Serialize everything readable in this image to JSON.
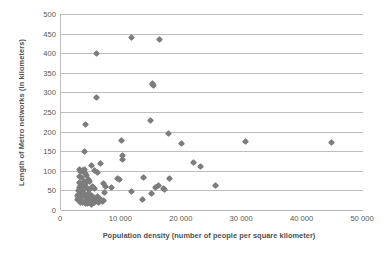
{
  "chart_data": {
    "type": "scatter",
    "title": "",
    "xlabel": "Population density (number of people per square kilometer)",
    "ylabel": "Length of Metro networks (in kilometers)",
    "xlim": [
      0,
      50000
    ],
    "ylim": [
      0,
      500
    ],
    "xticks": [
      0,
      10000,
      20000,
      30000,
      40000,
      50000
    ],
    "xtick_labels": [
      "0",
      "10 000",
      "20 000",
      "30 000",
      "40 000",
      "50 000"
    ],
    "yticks": [
      0,
      50,
      100,
      150,
      200,
      250,
      300,
      350,
      400,
      450,
      500
    ],
    "ytick_labels": [
      "0",
      "50",
      "100",
      "150",
      "200",
      "250",
      "300",
      "350",
      "400",
      "450",
      "500"
    ],
    "grid": "horizontal",
    "legend": "none",
    "marker": "diamond",
    "marker_color": "#7d7d7d",
    "series": [
      {
        "name": "Metro systems",
        "points": [
          [
            11700,
            441
          ],
          [
            16300,
            435
          ],
          [
            5800,
            399
          ],
          [
            5900,
            286
          ],
          [
            15100,
            322
          ],
          [
            15300,
            317
          ],
          [
            15200,
            319
          ],
          [
            4000,
            219
          ],
          [
            14900,
            229
          ],
          [
            17800,
            196
          ],
          [
            30500,
            176
          ],
          [
            44800,
            171
          ],
          [
            19900,
            169
          ],
          [
            10000,
            178
          ],
          [
            3900,
            148
          ],
          [
            10100,
            140
          ],
          [
            10200,
            130
          ],
          [
            21900,
            121
          ],
          [
            23100,
            110
          ],
          [
            5000,
            113
          ],
          [
            6600,
            118
          ],
          [
            3000,
            103
          ],
          [
            3300,
            99
          ],
          [
            3500,
            101
          ],
          [
            3700,
            97
          ],
          [
            3900,
            104
          ],
          [
            4100,
            93
          ],
          [
            4300,
            88
          ],
          [
            3100,
            86
          ],
          [
            3400,
            82
          ],
          [
            5600,
            100
          ],
          [
            6000,
            96
          ],
          [
            9300,
            80
          ],
          [
            9700,
            79
          ],
          [
            18000,
            81
          ],
          [
            13700,
            84
          ],
          [
            25600,
            62
          ],
          [
            7000,
            67
          ],
          [
            7400,
            59
          ],
          [
            7200,
            45
          ],
          [
            8400,
            57
          ],
          [
            11700,
            47
          ],
          [
            13500,
            26
          ],
          [
            15000,
            43
          ],
          [
            15600,
            58
          ],
          [
            16100,
            62
          ],
          [
            16900,
            54
          ],
          [
            17200,
            53
          ],
          [
            3000,
            70
          ],
          [
            3200,
            63
          ],
          [
            3600,
            66
          ],
          [
            4000,
            60
          ],
          [
            4400,
            56
          ],
          [
            4800,
            52
          ],
          [
            5200,
            61
          ],
          [
            5600,
            55
          ],
          [
            2900,
            50
          ],
          [
            3100,
            46
          ],
          [
            3300,
            42
          ],
          [
            3500,
            38
          ],
          [
            3700,
            44
          ],
          [
            3900,
            40
          ],
          [
            4100,
            36
          ],
          [
            4300,
            33
          ],
          [
            4500,
            41
          ],
          [
            4700,
            35
          ],
          [
            4900,
            30
          ],
          [
            5100,
            37
          ],
          [
            5400,
            31
          ],
          [
            5700,
            27
          ],
          [
            6000,
            34
          ],
          [
            6300,
            29
          ],
          [
            2800,
            27
          ],
          [
            3000,
            23
          ],
          [
            3200,
            20
          ],
          [
            3400,
            25
          ],
          [
            3600,
            18
          ],
          [
            3800,
            22
          ],
          [
            4000,
            16
          ],
          [
            4200,
            21
          ],
          [
            4400,
            17
          ],
          [
            4600,
            24
          ],
          [
            4800,
            19
          ],
          [
            5000,
            15
          ],
          [
            5300,
            22
          ],
          [
            5600,
            18
          ],
          [
            5900,
            23
          ],
          [
            6200,
            20
          ],
          [
            6500,
            26
          ],
          [
            6800,
            22
          ],
          [
            7100,
            25
          ],
          [
            2700,
            36
          ],
          [
            2900,
            32
          ],
          [
            3100,
            57
          ],
          [
            3300,
            53
          ],
          [
            3500,
            49
          ],
          [
            4600,
            77
          ],
          [
            4800,
            72
          ],
          [
            3900,
            73
          ],
          [
            4200,
            69
          ]
        ]
      }
    ]
  }
}
